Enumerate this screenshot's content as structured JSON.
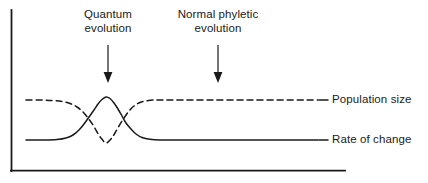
{
  "figure": {
    "width": 428,
    "height": 183,
    "background": "#ffffff",
    "ink_color": "#1a1a1a"
  },
  "chart_data": {
    "type": "line",
    "title": "",
    "xlabel": "",
    "ylabel": "",
    "grid": false,
    "axes": {
      "style": "L-shaped",
      "ticks": false,
      "tick_labels": false,
      "x_axis_y": 171,
      "x_axis_start": 11,
      "x_axis_end": 345,
      "y_axis_x": 11,
      "y_axis_top": 10,
      "y_axis_bottom": 171
    },
    "legend": {
      "position": "right-inline",
      "entries": [
        {
          "name": "Population size",
          "style": "dashed"
        },
        {
          "name": "Rate of change",
          "style": "solid"
        }
      ]
    },
    "series": [
      {
        "name": "Population size",
        "style": "dashed",
        "color": "#1a1a1a",
        "description": "High plateau that dips sharply to a trough during the quantum evolution event, then recovers to the original plateau",
        "baseline_y": 100,
        "extreme_y": 143,
        "extreme_kind": "trough",
        "extreme_x": 106,
        "points": [
          [
            26,
            100
          ],
          [
            40,
            100
          ],
          [
            52,
            100.5
          ],
          [
            62,
            101.5
          ],
          [
            70,
            103.5
          ],
          [
            77,
            107
          ],
          [
            83,
            112
          ],
          [
            88,
            118
          ],
          [
            93,
            125
          ],
          [
            97,
            132
          ],
          [
            101,
            138
          ],
          [
            106,
            143
          ],
          [
            111,
            139
          ],
          [
            115,
            133
          ],
          [
            119,
            126
          ],
          [
            124,
            118
          ],
          [
            129,
            111
          ],
          [
            134,
            106
          ],
          [
            140,
            102.5
          ],
          [
            147,
            100.8
          ],
          [
            156,
            100
          ],
          [
            175,
            100
          ],
          [
            210,
            100
          ],
          [
            250,
            100
          ],
          [
            290,
            100
          ],
          [
            318,
            100
          ]
        ]
      },
      {
        "name": "Rate of change",
        "style": "solid",
        "color": "#1a1a1a",
        "description": "Low baseline that spikes to a sharp peak during the quantum evolution event, then returns to baseline",
        "baseline_y": 140,
        "extreme_y": 97,
        "extreme_kind": "peak",
        "extreme_x": 106,
        "points": [
          [
            26,
            140
          ],
          [
            45,
            140
          ],
          [
            57,
            139.5
          ],
          [
            66,
            138
          ],
          [
            73,
            135
          ],
          [
            79,
            130
          ],
          [
            84,
            124
          ],
          [
            89,
            117
          ],
          [
            94,
            110
          ],
          [
            98,
            104
          ],
          [
            102,
            99.5
          ],
          [
            106,
            97
          ],
          [
            110,
            98.5
          ],
          [
            114,
            103
          ],
          [
            118,
            109
          ],
          [
            122,
            116
          ],
          [
            126,
            123
          ],
          [
            131,
            129
          ],
          [
            136,
            134
          ],
          [
            142,
            137.5
          ],
          [
            150,
            139.3
          ],
          [
            160,
            140
          ],
          [
            180,
            140
          ],
          [
            215,
            140
          ],
          [
            255,
            140
          ],
          [
            295,
            140
          ],
          [
            318,
            140
          ]
        ]
      }
    ],
    "annotations": [
      {
        "id": "quantum-evolution",
        "text": "Quantum\nevolution",
        "arrow_x": 108,
        "arrow_top": 45,
        "arrow_tip": 82,
        "direction": "down"
      },
      {
        "id": "normal-phyletic-evolution",
        "text": "Normal phyletic\nevolution",
        "arrow_x": 218,
        "arrow_top": 45,
        "arrow_tip": 82,
        "direction": "down"
      }
    ]
  },
  "annotations": {
    "quantum": {
      "label": "Quantum\nevolution"
    },
    "phyletic": {
      "label": "Normal phyletic\nevolution"
    }
  },
  "legend": {
    "population": {
      "label": "Population size"
    },
    "rate": {
      "label": "Rate of change"
    }
  }
}
